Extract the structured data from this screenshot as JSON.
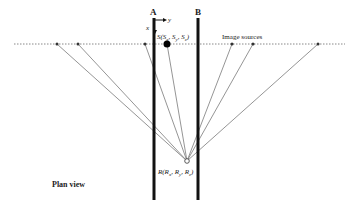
{
  "diagram": {
    "title": "Plan view",
    "walls": [
      {
        "id": "A",
        "label": "A"
      },
      {
        "id": "B",
        "label": "B"
      }
    ],
    "axes": {
      "x_label": "x",
      "y_label": "y"
    },
    "source": {
      "label_main": "S(S",
      "subs": [
        "x",
        "y",
        "z"
      ],
      "full_label": "S(Sx, Sy, Sz)"
    },
    "receiver": {
      "label_main": "R(R",
      "subs": [
        "x",
        "y",
        "z"
      ],
      "full_label": "R(Rx, Ry, Rz)"
    },
    "image_sources_label": "Image sources",
    "image_source_count": 6,
    "colors": {
      "wall": "#111111",
      "ray": "#7a7a7a",
      "dotted": "#888888",
      "source": "#000000"
    }
  }
}
